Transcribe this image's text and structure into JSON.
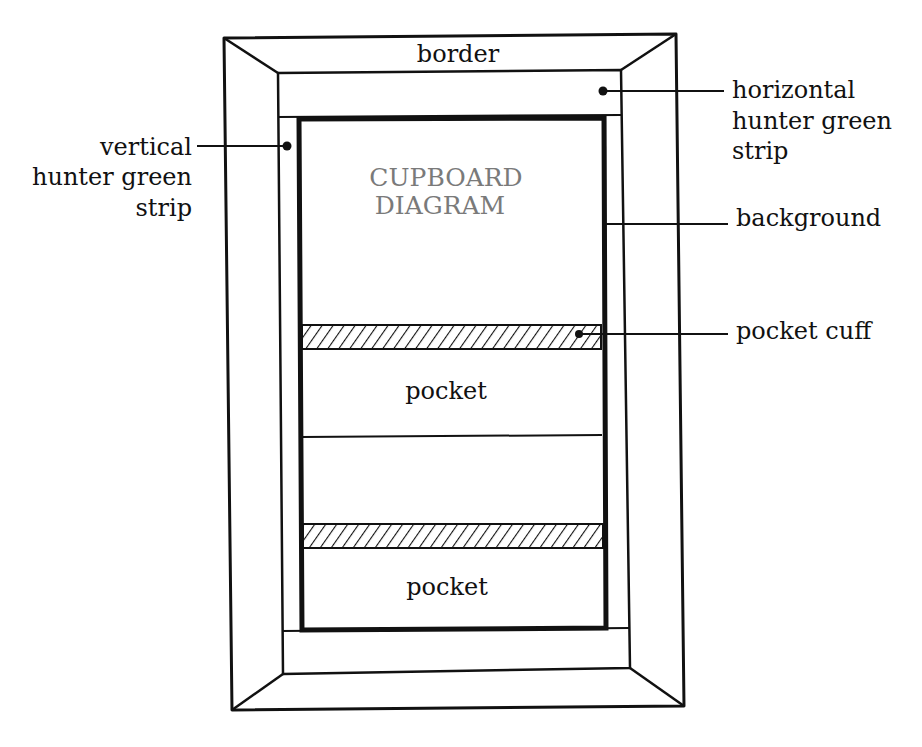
{
  "diagram": {
    "title_line1": "CUPBOARD",
    "title_line2": "DIAGRAM",
    "colors": {
      "ink": "#111111",
      "title_gray": "#7a7a7a",
      "paper": "#ffffff"
    },
    "regions": {
      "border": "border",
      "pocket_upper": "pocket",
      "pocket_lower": "pocket"
    },
    "callouts": {
      "vertical_strip": {
        "line1": "vertical",
        "line2": "hunter green",
        "line3": "strip"
      },
      "horizontal_strip": {
        "line1": "horizontal",
        "line2": "hunter green",
        "line3": "strip"
      },
      "background": "background",
      "pocket_cuff": "pocket cuff"
    }
  }
}
